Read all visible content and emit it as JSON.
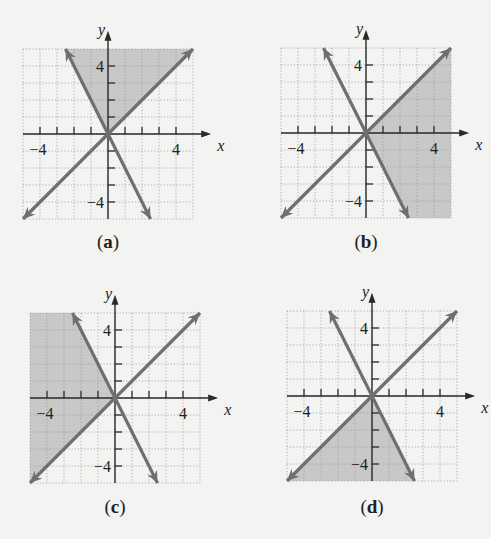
{
  "figure": {
    "panels": [
      {
        "id": "a",
        "caption": "(a)",
        "shade": "between-top",
        "origin": [
          108,
          134
        ],
        "caption_pos": [
          78,
          231
        ]
      },
      {
        "id": "b",
        "caption": "(b)",
        "shade": "between-right",
        "origin": [
          366,
          133
        ],
        "caption_pos": [
          336,
          231
        ]
      },
      {
        "id": "c",
        "caption": "(c)",
        "shade": "between-left",
        "origin": [
          115,
          398
        ],
        "caption_pos": [
          85,
          496
        ]
      },
      {
        "id": "d",
        "caption": "(d)",
        "shade": "between-bottom",
        "origin": [
          372,
          396
        ],
        "caption_pos": [
          342,
          496
        ]
      }
    ],
    "axis": {
      "x_label": "x",
      "y_label": "y",
      "tick_label_pos": "4",
      "tick_label_neg": "−4"
    },
    "colors": {
      "background": "#f3f3f1",
      "grid": "#9a9a9a",
      "shade": "#c8c8c8",
      "line": "#6f6f6f",
      "axis": "#2a2a2a",
      "text": "#222222"
    }
  },
  "chart_data": [
    {
      "type": "line",
      "title": "(a)",
      "xlabel": "x",
      "ylabel": "y",
      "xlim": [
        -5,
        5
      ],
      "ylim": [
        -5,
        5
      ],
      "grid": true,
      "ticks": {
        "x": [
          -4,
          -3,
          -2,
          -1,
          1,
          2,
          3,
          4
        ],
        "y": [
          -4,
          -3,
          -2,
          -1,
          1,
          2,
          3,
          4
        ],
        "labeled": [
          -4,
          4
        ]
      },
      "series": [
        {
          "name": "y = x",
          "slope": 1,
          "intercept": 0
        },
        {
          "name": "y = -2x",
          "slope": -2,
          "intercept": 0
        }
      ],
      "shaded_region": "y >= x and y >= -2x"
    },
    {
      "type": "line",
      "title": "(b)",
      "xlabel": "x",
      "ylabel": "y",
      "xlim": [
        -5,
        5
      ],
      "ylim": [
        -5,
        5
      ],
      "grid": true,
      "ticks": {
        "x": [
          -4,
          -3,
          -2,
          -1,
          1,
          2,
          3,
          4
        ],
        "y": [
          -4,
          -3,
          -2,
          -1,
          1,
          2,
          3,
          4
        ],
        "labeled": [
          -4,
          4
        ]
      },
      "series": [
        {
          "name": "y = x",
          "slope": 1,
          "intercept": 0
        },
        {
          "name": "y = -2x",
          "slope": -2,
          "intercept": 0
        }
      ],
      "shaded_region": "y <= x and y >= -2x"
    },
    {
      "type": "line",
      "title": "(c)",
      "xlabel": "x",
      "ylabel": "y",
      "xlim": [
        -5,
        5
      ],
      "ylim": [
        -5,
        5
      ],
      "grid": true,
      "ticks": {
        "x": [
          -4,
          -3,
          -2,
          -1,
          1,
          2,
          3,
          4
        ],
        "y": [
          -4,
          -3,
          -2,
          -1,
          1,
          2,
          3,
          4
        ],
        "labeled": [
          -4,
          4
        ]
      },
      "series": [
        {
          "name": "y = x",
          "slope": 1,
          "intercept": 0
        },
        {
          "name": "y = -2x",
          "slope": -2,
          "intercept": 0
        }
      ],
      "shaded_region": "y >= x and y <= -2x"
    },
    {
      "type": "line",
      "title": "(d)",
      "xlabel": "x",
      "ylabel": "y",
      "xlim": [
        -5,
        5
      ],
      "ylim": [
        -5,
        5
      ],
      "grid": true,
      "ticks": {
        "x": [
          -4,
          -3,
          -2,
          -1,
          1,
          2,
          3,
          4
        ],
        "y": [
          -4,
          -3,
          -2,
          -1,
          1,
          2,
          3,
          4
        ],
        "labeled": [
          -4,
          4
        ]
      },
      "series": [
        {
          "name": "y = x",
          "slope": 1,
          "intercept": 0
        },
        {
          "name": "y = -2x",
          "slope": -2,
          "intercept": 0
        }
      ],
      "shaded_region": "y <= x and y <= -2x"
    }
  ]
}
